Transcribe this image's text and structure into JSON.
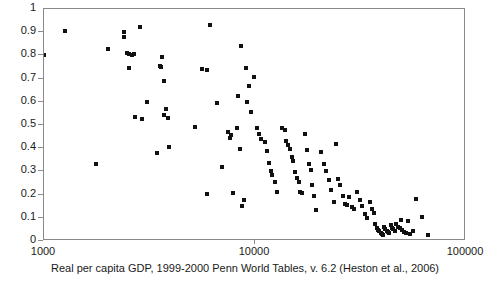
{
  "chart_data": {
    "type": "scatter",
    "title": "",
    "subtitle": "",
    "xlabel": "Real per capita GDP, 1999-2000 Penn World Tables, v. 6.2 (Heston et al., 2006)",
    "ylabel": "",
    "xscale": "log",
    "yscale": "linear",
    "xlim": [
      1000,
      100000
    ],
    "ylim": [
      0,
      1
    ],
    "grid": false,
    "legend": null,
    "marker": {
      "shape": "square",
      "color": "#111111",
      "size_px": 4
    },
    "xticks": [
      1000,
      10000,
      100000
    ],
    "xtick_labels": [
      "1000",
      "10000",
      "100000"
    ],
    "yticks": [
      0,
      0.1,
      0.2,
      0.3,
      0.4,
      0.5,
      0.6,
      0.7,
      0.8,
      0.9,
      1
    ],
    "ytick_labels": [
      "0",
      "0.1",
      "0.2",
      "0.3",
      "0.4",
      "0.5",
      "0.6",
      "0.7",
      "0.8",
      "0.9",
      "1"
    ],
    "series": [
      {
        "name": "countries",
        "points": [
          [
            1000,
            0.802
          ],
          [
            1255,
            0.905
          ],
          [
            1760,
            0.333
          ],
          [
            2000,
            0.827
          ],
          [
            2390,
            0.901
          ],
          [
            2405,
            0.878
          ],
          [
            2480,
            0.812
          ],
          [
            2530,
            0.805
          ],
          [
            2620,
            0.8
          ],
          [
            2660,
            0.806
          ],
          [
            2700,
            0.535
          ],
          [
            2520,
            0.745
          ],
          [
            2860,
            0.923
          ],
          [
            2900,
            0.527
          ],
          [
            3080,
            0.597
          ],
          [
            3450,
            0.38
          ],
          [
            3560,
            0.755
          ],
          [
            3600,
            0.752
          ],
          [
            3640,
            0.795
          ],
          [
            3700,
            0.691
          ],
          [
            3720,
            0.543
          ],
          [
            3800,
            0.57
          ],
          [
            3860,
            0.532
          ],
          [
            3900,
            0.406
          ],
          [
            5200,
            0.492
          ],
          [
            5600,
            0.74
          ],
          [
            5900,
            0.738
          ],
          [
            5950,
            0.201
          ],
          [
            6150,
            0.93
          ],
          [
            6600,
            0.593
          ],
          [
            7000,
            0.318
          ],
          [
            7450,
            0.47
          ],
          [
            7600,
            0.446
          ],
          [
            7700,
            0.455
          ],
          [
            7900,
            0.207
          ],
          [
            8200,
            0.487
          ],
          [
            8300,
            0.625
          ],
          [
            8450,
            0.396
          ],
          [
            8600,
            0.84
          ],
          [
            8700,
            0.153
          ],
          [
            8900,
            0.176
          ],
          [
            9100,
            0.744
          ],
          [
            9200,
            0.599
          ],
          [
            9400,
            0.666
          ],
          [
            9600,
            0.556
          ],
          [
            9900,
            0.708
          ],
          [
            10200,
            0.489
          ],
          [
            10400,
            0.462
          ],
          [
            10700,
            0.44
          ],
          [
            11100,
            0.425
          ],
          [
            11400,
            0.389
          ],
          [
            11600,
            0.338
          ],
          [
            11900,
            0.3
          ],
          [
            12100,
            0.284
          ],
          [
            12400,
            0.253
          ],
          [
            12700,
            0.21
          ],
          [
            13100,
            0.0
          ],
          [
            13400,
            0.487
          ],
          [
            13800,
            0.48
          ],
          [
            14100,
            0.432
          ],
          [
            14300,
            0.415
          ],
          [
            14600,
            0.398
          ],
          [
            14900,
            0.36
          ],
          [
            15200,
            0.344
          ],
          [
            15500,
            0.296
          ],
          [
            15800,
            0.273
          ],
          [
            16100,
            0.256
          ],
          [
            16400,
            0.211
          ],
          [
            16700,
            0.205
          ],
          [
            15000,
            0.0
          ],
          [
            17200,
            0.46
          ],
          [
            17600,
            0.393
          ],
          [
            18000,
            0.33
          ],
          [
            18400,
            0.305
          ],
          [
            18700,
            0.243
          ],
          [
            19000,
            0.196
          ],
          [
            17000,
            0.0
          ],
          [
            19500,
            0.135
          ],
          [
            20000,
            0.0
          ],
          [
            20600,
            0.382
          ],
          [
            21200,
            0.33
          ],
          [
            21800,
            0.3
          ],
          [
            22400,
            0.265
          ],
          [
            23000,
            0.221
          ],
          [
            23600,
            0.167
          ],
          [
            24200,
            0.42
          ],
          [
            24800,
            0.268
          ],
          [
            25400,
            0.24
          ],
          [
            26000,
            0.196
          ],
          [
            26600,
            0.16
          ],
          [
            27200,
            0.155
          ],
          [
            28000,
            0.19
          ],
          [
            28800,
            0.145
          ],
          [
            29600,
            0.136
          ],
          [
            30500,
            0.21
          ],
          [
            31400,
            0.175
          ],
          [
            32300,
            0.15
          ],
          [
            33200,
            0.116
          ],
          [
            34100,
            0.098
          ],
          [
            35000,
            0.17
          ],
          [
            35800,
            0.14
          ],
          [
            36500,
            0.12
          ],
          [
            37200,
            0.075
          ],
          [
            37800,
            0.055
          ],
          [
            38400,
            0.048
          ],
          [
            38900,
            0.042
          ],
          [
            39400,
            0.036
          ],
          [
            39900,
            0.03
          ],
          [
            40400,
            0.028
          ],
          [
            40900,
            0.06
          ],
          [
            41500,
            0.052
          ],
          [
            42100,
            0.045
          ],
          [
            42700,
            0.038
          ],
          [
            43300,
            0.033
          ],
          [
            43900,
            0.068
          ],
          [
            44600,
            0.058
          ],
          [
            45300,
            0.05
          ],
          [
            46000,
            0.044
          ],
          [
            46800,
            0.072
          ],
          [
            47600,
            0.062
          ],
          [
            48400,
            0.054
          ],
          [
            49200,
            0.09
          ],
          [
            50000,
            0.046
          ],
          [
            51000,
            0.04
          ],
          [
            52000,
            0.035
          ],
          [
            53000,
            0.085
          ],
          [
            54500,
            0.03
          ],
          [
            56000,
            0.044
          ],
          [
            58000,
            0.18
          ],
          [
            62000,
            0.102
          ],
          [
            66000,
            0.026
          ]
        ]
      }
    ]
  }
}
